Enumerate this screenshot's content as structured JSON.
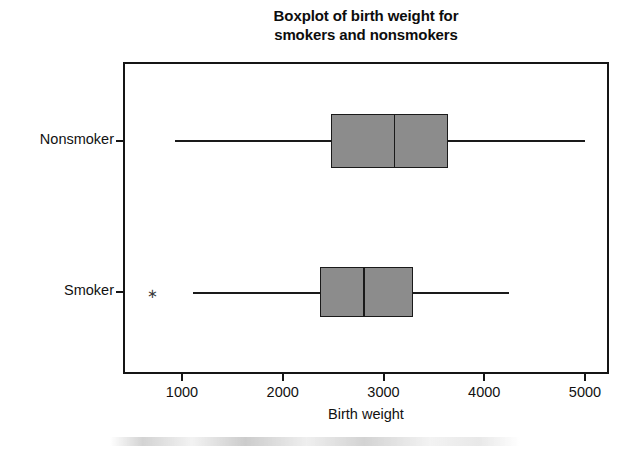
{
  "chart_data": {
    "type": "box",
    "title": "Boxplot of birth weight for smokers and nonsmokers",
    "title_lines": [
      "Boxplot of birth weight for",
      "smokers and nonsmokers"
    ],
    "orientation": "horizontal",
    "xlabel": "Birth weight",
    "ylabel": "",
    "xlim": [
      600,
      5250
    ],
    "xticks": [
      1000,
      2000,
      3000,
      4000,
      5000
    ],
    "xtick_labels": [
      "1000",
      "2000",
      "3000",
      "4000",
      "5000"
    ],
    "grid": false,
    "legend": false,
    "categories": [
      "Nonsmoker",
      "Smoker"
    ],
    "boxes": [
      {
        "category": "Nonsmoker",
        "whisker_low": 930,
        "q1": 2480,
        "median": 3100,
        "q3": 3640,
        "whisker_high": 5000,
        "outliers": []
      },
      {
        "category": "Smoker",
        "whisker_low": 1110,
        "q1": 2370,
        "median": 2800,
        "q3": 3290,
        "whisker_high": 4250,
        "outliers": [
          700
        ]
      }
    ],
    "colors": {
      "box_fill": "#8c8c8c",
      "box_edge": "#1a1a1a",
      "median": "#1a1a1a",
      "whisker": "#1a1a1a",
      "frame": "#151515",
      "background": "#ffffff",
      "text": "#111111"
    },
    "outlier_marker": "∗"
  },
  "axes": {
    "x_tick_labels": [
      "1000",
      "2000",
      "3000",
      "4000",
      "5000"
    ],
    "x_title": "Birth weight",
    "y_tick_labels": [
      "Nonsmoker",
      "Smoker"
    ]
  }
}
